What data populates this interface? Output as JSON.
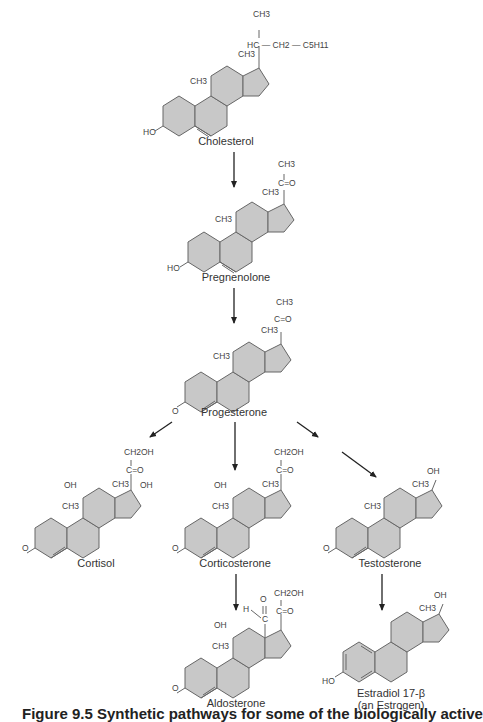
{
  "compounds": {
    "cholesterol": {
      "name": "Cholesterol",
      "groups": {
        "top": "CH3",
        "side": "HC",
        "chain1": "CH2",
        "chain2": "C5H11",
        "me18": "CH3",
        "me19": "CH3",
        "oh": "HO"
      }
    },
    "pregnenolone": {
      "name": "Pregnenolone",
      "groups": {
        "top": "CH3",
        "keto": "C=O",
        "me18": "CH3",
        "me19": "CH3",
        "oh": "HO"
      }
    },
    "progesterone": {
      "name": "Progesterone",
      "groups": {
        "top": "CH3",
        "keto": "C=O",
        "me18": "CH3",
        "me19": "CH3",
        "oxo": "O"
      }
    },
    "cortisol": {
      "name": "Cortisol",
      "groups": {
        "top": "CH2OH",
        "keto": "C=O",
        "oh11": "OH",
        "oh17": "OH",
        "me18": "CH3",
        "me19": "CH3",
        "oxo": "O"
      }
    },
    "corticosterone": {
      "name": "Corticosterone",
      "groups": {
        "top": "CH2OH",
        "keto": "C=O",
        "oh11": "OH",
        "me18": "CH3",
        "me19": "CH3",
        "oxo": "O"
      }
    },
    "testosterone": {
      "name": "Testosterone",
      "groups": {
        "oh17": "OH",
        "me18": "CH3",
        "me19": "CH3",
        "oxo": "O"
      }
    },
    "aldosterone": {
      "name": "Aldosterone",
      "groups": {
        "top": "CH2OH",
        "keto": "C=O",
        "ald_o": "O",
        "ald_h": "H",
        "ald_c": "C",
        "oh11": "OH",
        "me19": "CH3",
        "oxo": "O"
      }
    },
    "estradiol": {
      "name": "Estradiol 17-β",
      "subname": "(an Estrogen)",
      "groups": {
        "oh17": "OH",
        "me18": "CH3",
        "oh3": "HO"
      }
    }
  },
  "pathway": [
    {
      "from": "Cholesterol",
      "to": "Pregnenolone"
    },
    {
      "from": "Pregnenolone",
      "to": "Progesterone"
    },
    {
      "from": "Progesterone",
      "to": "Cortisol"
    },
    {
      "from": "Progesterone",
      "to": "Corticosterone"
    },
    {
      "from": "Progesterone",
      "to": "Testosterone"
    },
    {
      "from": "Corticosterone",
      "to": "Aldosterone"
    },
    {
      "from": "Testosterone",
      "to": "Estradiol 17-β"
    }
  ],
  "caption": "Figure 9.5  Synthetic pathways for some of the biologically active"
}
